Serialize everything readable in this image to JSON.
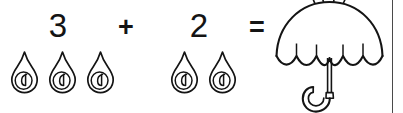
{
  "worksheet": {
    "type": "picture-addition-problem",
    "equation_text": "3 + 2 =",
    "theme": "rain-and-umbrella",
    "background_color": "#ffffff",
    "ink_color": "#141414"
  },
  "equation": {
    "first_addend": "3",
    "operator_plus": "+",
    "second_addend": "2",
    "operator_equals": "=",
    "answer": ""
  },
  "groups": [
    {
      "name": "first-addend-group",
      "count_label": "3",
      "icon": "raindrop-icon",
      "item_count": 3
    },
    {
      "name": "second-addend-group",
      "count_label": "2",
      "icon": "raindrop-icon",
      "item_count": 2
    }
  ],
  "result": {
    "name": "result-illustration",
    "icon": "umbrella-icon",
    "label": "umbrella"
  },
  "decorations": {
    "page_rule": "vertical-rule",
    "page_rule_color": "#4a4a4a"
  }
}
